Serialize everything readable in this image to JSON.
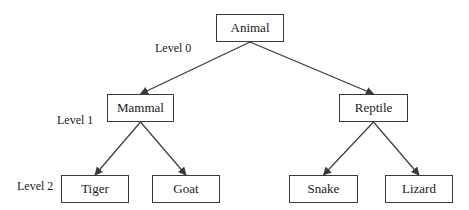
{
  "diagram": {
    "type": "tree",
    "colors": {
      "line": "#3a3a3a",
      "text": "#1a1a1a",
      "background": "#ffffff"
    },
    "nodes": [
      {
        "id": "animal",
        "label": "Animal",
        "level": 0,
        "x": 216,
        "y": 14,
        "w": 68,
        "h": 28
      },
      {
        "id": "mammal",
        "label": "Mammal",
        "level": 1,
        "x": 107,
        "y": 94,
        "w": 67,
        "h": 28
      },
      {
        "id": "reptile",
        "label": "Reptile",
        "level": 1,
        "x": 339,
        "y": 94,
        "w": 69,
        "h": 28
      },
      {
        "id": "tiger",
        "label": "Tiger",
        "level": 2,
        "x": 61,
        "y": 175,
        "w": 68,
        "h": 28
      },
      {
        "id": "goat",
        "label": "Goat",
        "level": 2,
        "x": 152,
        "y": 175,
        "w": 68,
        "h": 28
      },
      {
        "id": "snake",
        "label": "Snake",
        "level": 2,
        "x": 289,
        "y": 175,
        "w": 69,
        "h": 28
      },
      {
        "id": "lizard",
        "label": "Lizard",
        "level": 2,
        "x": 385,
        "y": 175,
        "w": 68,
        "h": 28
      }
    ],
    "edges": [
      {
        "from": "animal",
        "to": "mammal"
      },
      {
        "from": "animal",
        "to": "reptile"
      },
      {
        "from": "mammal",
        "to": "tiger"
      },
      {
        "from": "mammal",
        "to": "goat"
      },
      {
        "from": "reptile",
        "to": "snake"
      },
      {
        "from": "reptile",
        "to": "lizard"
      }
    ],
    "level_labels": [
      {
        "text": "Level 0",
        "x": 155,
        "y": 41
      },
      {
        "text": "Level 1",
        "x": 57,
        "y": 113
      },
      {
        "text": "Level 2",
        "x": 17,
        "y": 179
      }
    ]
  }
}
